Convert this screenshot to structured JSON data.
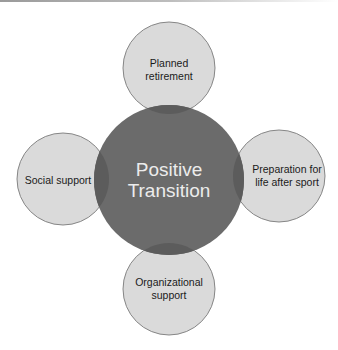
{
  "diagram": {
    "type": "hub-and-spoke",
    "colors": {
      "center_fill": "#6b6b6b",
      "overlap_fill": "#5c5c5c",
      "satellite_fill": "#dadada",
      "satellite_stroke": "#7a7a7a",
      "center_text": "#ececec",
      "satellite_text": "#1a1a1a"
    },
    "center": {
      "lines": [
        "Positive",
        "Transition"
      ]
    },
    "satellites": [
      {
        "id": "top",
        "lines": [
          "Planned",
          "retirement"
        ]
      },
      {
        "id": "right",
        "lines": [
          "Preparation for",
          "life after sport"
        ]
      },
      {
        "id": "bottom",
        "lines": [
          "Organizational",
          "support"
        ]
      },
      {
        "id": "left",
        "lines": [
          "Social support"
        ]
      }
    ]
  }
}
